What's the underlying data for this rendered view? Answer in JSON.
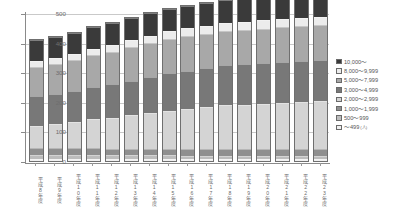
{
  "chart_data": {
    "type": "bar",
    "subtype": "stacked-column",
    "title": "",
    "xlabel": "",
    "ylabel": "",
    "ylim": [
      0,
      500
    ],
    "ytick_values": [
      0,
      100,
      200,
      300,
      400,
      500
    ],
    "ytick_labels": [
      "0",
      "100",
      "200",
      "300",
      "400",
      "500"
    ],
    "grid": true,
    "legend_position": "right",
    "unit_note": "(人)",
    "categories": [
      "平成8年度",
      "平成9年度",
      "平成10年度",
      "平成11年度",
      "平成12年度",
      "平成13年度",
      "平成14年度",
      "平成15年度",
      "平成16年度",
      "平成17年度",
      "平成18年度",
      "平成19年度",
      "平成20年度",
      "平成21年度",
      "平成22年度",
      "平成23年度"
    ],
    "series": [
      {
        "name": "～499",
        "color": "#f0f0f0",
        "values": [
          8,
          8,
          8,
          8,
          7,
          7,
          7,
          7,
          6,
          6,
          6,
          6,
          6,
          6,
          6,
          6
        ]
      },
      {
        "name": "500～999",
        "color": "#bdbdbd",
        "values": [
          14,
          14,
          14,
          14,
          13,
          13,
          13,
          13,
          12,
          12,
          12,
          12,
          12,
          12,
          12,
          12
        ]
      },
      {
        "name": "1,000～1,999",
        "color": "#8f8f8f",
        "values": [
          22,
          22,
          22,
          23,
          22,
          22,
          22,
          22,
          21,
          21,
          21,
          21,
          21,
          21,
          21,
          21
        ]
      },
      {
        "name": "2,000～2,999",
        "color": "#d4d4d4",
        "values": [
          76,
          82,
          88,
          96,
          104,
          112,
          120,
          128,
          136,
          143,
          150,
          152,
          155,
          158,
          160,
          163
        ]
      },
      {
        "name": "3,000～4,999",
        "color": "#787878",
        "values": [
          100,
          102,
          106,
          110,
          114,
          118,
          122,
          126,
          130,
          132,
          134,
          136,
          137,
          138,
          139,
          140
        ]
      },
      {
        "name": "5,000～7,999",
        "color": "#a8a8a8",
        "values": [
          98,
          100,
          103,
          106,
          110,
          112,
          114,
          116,
          116,
          116,
          116,
          116,
          116,
          117,
          117,
          117
        ]
      },
      {
        "name": "8,000～9,999",
        "color": "#ececec",
        "values": [
          20,
          20,
          21,
          22,
          23,
          24,
          25,
          26,
          27,
          27,
          28,
          28,
          28,
          28,
          28,
          28
        ]
      },
      {
        "name": "10,000～",
        "color": "#3a3a3a",
        "values": [
          72,
          72,
          72,
          73,
          74,
          75,
          76,
          77,
          77,
          76,
          76,
          76,
          76,
          76,
          76,
          76
        ]
      }
    ],
    "totals": [
      410,
      420,
      434,
      452,
      467,
      483,
      499,
      515,
      525,
      533,
      543,
      547,
      551,
      556,
      559,
      563
    ]
  },
  "legend": {
    "entries": [
      {
        "label": "10,000～",
        "color": "#3a3a3a",
        "unit": ""
      },
      {
        "label": "8,000～9,999",
        "color": "#ececec",
        "unit": ""
      },
      {
        "label": "5,000～7,999",
        "color": "#a8a8a8",
        "unit": ""
      },
      {
        "label": "3,000～4,999",
        "color": "#787878",
        "unit": ""
      },
      {
        "label": "2,000～2,999",
        "color": "#d4d4d4",
        "unit": ""
      },
      {
        "label": "1,000～1,999",
        "color": "#8f8f8f",
        "unit": ""
      },
      {
        "label": "500～999",
        "color": "#bdbdbd",
        "unit": ""
      },
      {
        "label": "～499",
        "color": "#f0f0f0",
        "unit": "(人)"
      }
    ]
  },
  "colors": {
    "axis": "#8a8a8a",
    "grid": "#c9c9c9",
    "text": "#6b6b6b",
    "background": "#ffffff"
  }
}
